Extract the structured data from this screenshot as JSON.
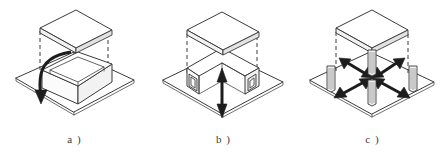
{
  "figure": {
    "background_color": "#ffffff",
    "line_color": "#3a3a3a",
    "arrow_color": "#1d1d1d",
    "panel_count": 3
  },
  "panels": [
    {
      "id": "a",
      "label": "a )",
      "caption_text": "a )",
      "description": "Base plate with open box and lid lifted above; curved arrow inside box",
      "elements": {
        "base_plate": "isometric-square-base-plate",
        "box": "open-rectangular-box",
        "lid": "flat-slab-lid-raised",
        "guides": "dashed-vertical-alignment-lines",
        "arrow": "curved-arrow-down-left"
      },
      "arrow_type": "curved-single-headed",
      "arrow_count": 1
    },
    {
      "id": "b",
      "label": "b )",
      "caption_text": "b )",
      "description": "Base plate with corner wall structure having square openings; vertical double arrow",
      "elements": {
        "base_plate": "isometric-square-base-plate",
        "walls": "corner-wall-structure-with-openings",
        "lid": "flat-slab-lid-raised",
        "guides": "dashed-vertical-alignment-lines",
        "arrow": "vertical-double-headed-arrow"
      },
      "arrow_type": "vertical-double-headed",
      "arrow_count": 1,
      "opening_count": 2
    },
    {
      "id": "c",
      "label": "c )",
      "caption_text": "c )",
      "description": "Base plate with four cylindrical posts; four radial double arrows; lid raised above",
      "elements": {
        "base_plate": "isometric-square-base-plate",
        "posts": "four-cylindrical-columns",
        "lid": "flat-slab-lid-raised",
        "guides": "dashed-vertical-alignment-lines",
        "arrows": "four-radial-double-headed-arrows"
      },
      "arrow_type": "radial-double-headed",
      "arrow_count": 4,
      "post_count": 4
    }
  ]
}
